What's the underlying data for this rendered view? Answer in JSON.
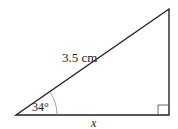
{
  "diagram": {
    "type": "right-triangle",
    "hypotenuse_label": "3.5 cm",
    "angle_label": "34°",
    "base_label": "x",
    "right_angle_marker": true,
    "stroke_color": "#222222",
    "arc_color": "#888888"
  }
}
